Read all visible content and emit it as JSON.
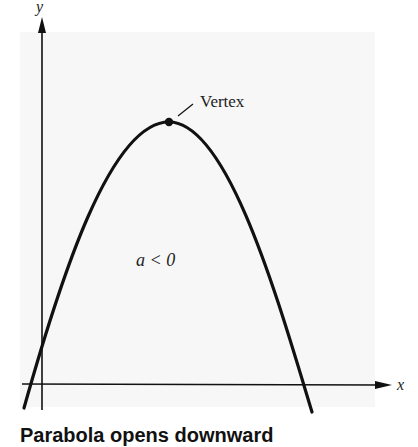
{
  "diagram": {
    "axes": {
      "x_label": "x",
      "y_label": "y"
    },
    "vertex_label": "Vertex",
    "condition_label": "a < 0",
    "caption_partial": "Parabola opens downward",
    "colors": {
      "curve": "#111111",
      "axes": "#111111",
      "background": "#f7f7f7"
    }
  }
}
